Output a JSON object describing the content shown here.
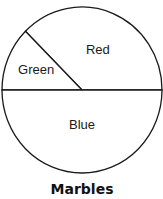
{
  "chart_data": {
    "type": "pie",
    "title": "Marbles",
    "slices": [
      {
        "label": "Red",
        "value": 37.5
      },
      {
        "label": "Green",
        "value": 12.5
      },
      {
        "label": "Blue",
        "value": 50
      }
    ],
    "unit": "percent (estimated from angles)",
    "legend": "none",
    "slice_fill": "#ffffff",
    "stroke_color": "#1a1a1a"
  }
}
